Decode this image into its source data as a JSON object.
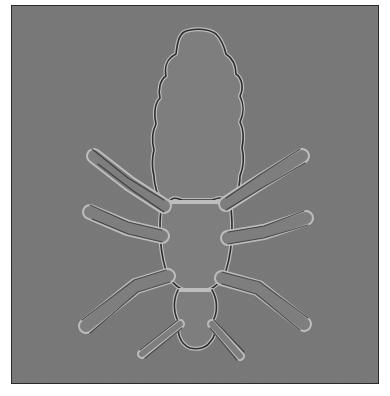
{
  "image": {
    "subject": "louse under microscope",
    "background_color": "#7b7b7b",
    "outline_dark": "#2e2e2e",
    "outline_light": "#b8b8b8",
    "page_color": "#ffffff"
  }
}
